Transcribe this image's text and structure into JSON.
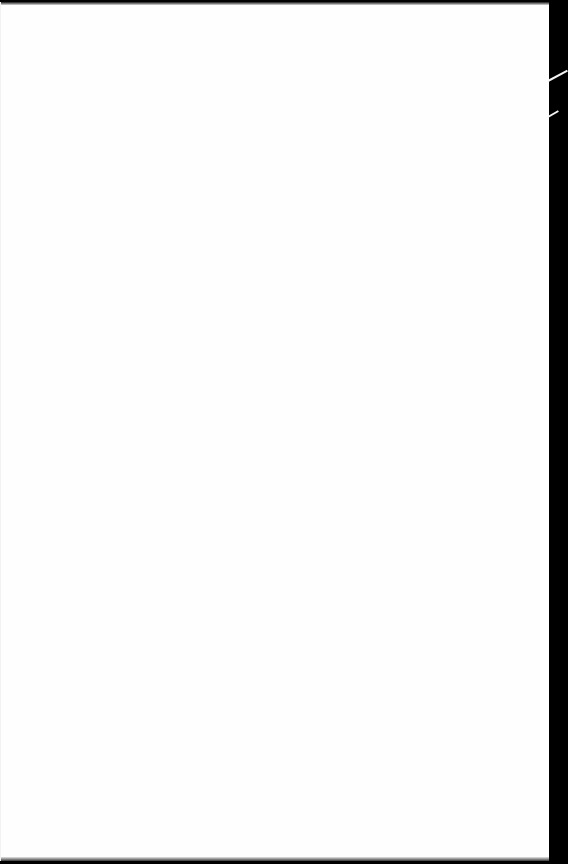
{
  "document": {
    "type": "scanned-page",
    "content": "",
    "page_color": "#fefefe",
    "spine_color": "#000000"
  }
}
